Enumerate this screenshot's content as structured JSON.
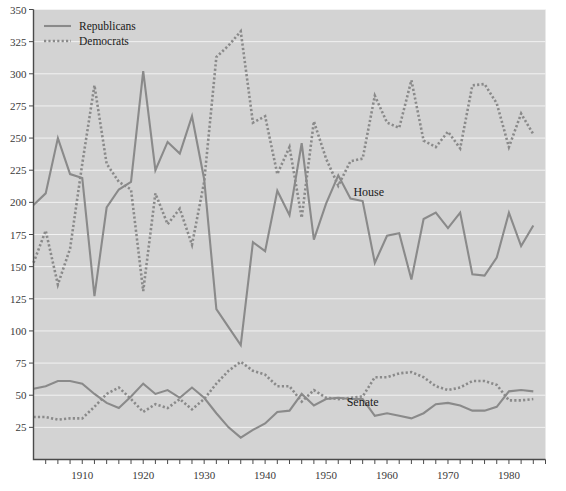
{
  "chart_data": {
    "type": "line",
    "title": "",
    "subtitle": "",
    "xlabel": "",
    "ylabel": "",
    "xlim": [
      1902,
      1986
    ],
    "ylim": [
      0,
      350
    ],
    "y_ticks": [
      25,
      50,
      75,
      100,
      125,
      150,
      175,
      200,
      225,
      250,
      275,
      300,
      325,
      350
    ],
    "x_ticks": [
      1904,
      1906,
      1908,
      1910,
      1912,
      1914,
      1916,
      1918,
      1920,
      1922,
      1924,
      1926,
      1928,
      1930,
      1932,
      1934,
      1936,
      1938,
      1940,
      1942,
      1944,
      1946,
      1948,
      1950,
      1952,
      1954,
      1956,
      1958,
      1960,
      1962,
      1964,
      1966,
      1968,
      1970,
      1972,
      1974,
      1976,
      1978,
      1980,
      1982,
      1984,
      1986
    ],
    "x_tick_labels": [
      "1910",
      "1920",
      "1930",
      "1940",
      "1950",
      "1960",
      "1970",
      "1980"
    ],
    "x_tick_label_values": [
      1910,
      1920,
      1930,
      1940,
      1950,
      1960,
      1970,
      1980
    ],
    "grid": true,
    "grid_axis": "y",
    "legend_position": "top-left",
    "plot_background_color": "#d3d3d3",
    "line_color": "#8a8a8a",
    "legend": [
      {
        "name": "Republicans",
        "style": "solid"
      },
      {
        "name": "Democrats",
        "style": "dotted"
      }
    ],
    "annotations": [
      {
        "text": "House",
        "x": 1957,
        "y": 205
      },
      {
        "text": "Senate",
        "x": 1956,
        "y": 42
      }
    ],
    "x": [
      1902,
      1904,
      1906,
      1908,
      1910,
      1912,
      1914,
      1916,
      1918,
      1920,
      1922,
      1924,
      1926,
      1928,
      1930,
      1932,
      1934,
      1936,
      1938,
      1940,
      1942,
      1944,
      1946,
      1948,
      1950,
      1952,
      1954,
      1956,
      1958,
      1960,
      1962,
      1964,
      1966,
      1968,
      1970,
      1972,
      1974,
      1976,
      1978,
      1980,
      1982,
      1984
    ],
    "series": [
      {
        "name": "Republicans",
        "chamber": "House",
        "style": "solid",
        "values": [
          198,
          207,
          250,
          222,
          219,
          127,
          196,
          210,
          216,
          302,
          225,
          247,
          238,
          267,
          218,
          117,
          103,
          89,
          169,
          162,
          209,
          190,
          246,
          171,
          199,
          221,
          203,
          201,
          153,
          174,
          176,
          140,
          187,
          192,
          180,
          192,
          144,
          143,
          157,
          192,
          166,
          182
        ]
      },
      {
        "name": "Democrats",
        "chamber": "House",
        "style": "dotted",
        "values": [
          153,
          178,
          136,
          164,
          230,
          291,
          230,
          216,
          210,
          131,
          207,
          183,
          195,
          167,
          216,
          313,
          322,
          333,
          262,
          267,
          222,
          243,
          188,
          263,
          234,
          213,
          232,
          234,
          283,
          262,
          258,
          295,
          248,
          243,
          255,
          242,
          291,
          292,
          277,
          243,
          269,
          253
        ]
      },
      {
        "name": "Republicans",
        "chamber": "Senate",
        "style": "solid",
        "values": [
          55,
          57,
          61,
          61,
          59,
          51,
          44,
          40,
          49,
          59,
          51,
          54,
          48,
          56,
          48,
          36,
          25,
          17,
          23,
          28,
          37,
          38,
          51,
          42,
          47,
          48,
          47,
          47,
          34,
          36,
          34,
          32,
          36,
          43,
          44,
          42,
          38,
          38,
          41,
          53,
          54,
          53
        ]
      },
      {
        "name": "Democrats",
        "chamber": "Senate",
        "style": "dotted",
        "values": [
          33,
          33,
          31,
          32,
          32,
          41,
          51,
          56,
          47,
          37,
          43,
          40,
          47,
          39,
          47,
          59,
          69,
          76,
          69,
          66,
          57,
          57,
          45,
          54,
          48,
          47,
          48,
          49,
          64,
          64,
          67,
          68,
          64,
          57,
          54,
          56,
          61,
          61,
          58,
          46,
          46,
          47
        ]
      }
    ]
  },
  "legend": {
    "republicans_label": "Republicans",
    "democrats_label": "Democrats"
  },
  "annotations": {
    "house_label": "House",
    "senate_label": "Senate"
  },
  "y_axis": {
    "labels": [
      "350",
      "325",
      "300",
      "275",
      "250",
      "225",
      "200",
      "175",
      "150",
      "125",
      "100",
      "75",
      "50",
      "25"
    ]
  },
  "x_axis": {
    "labels": [
      "1910",
      "1920",
      "1930",
      "1940",
      "1950",
      "1960",
      "1970",
      "1980"
    ]
  }
}
